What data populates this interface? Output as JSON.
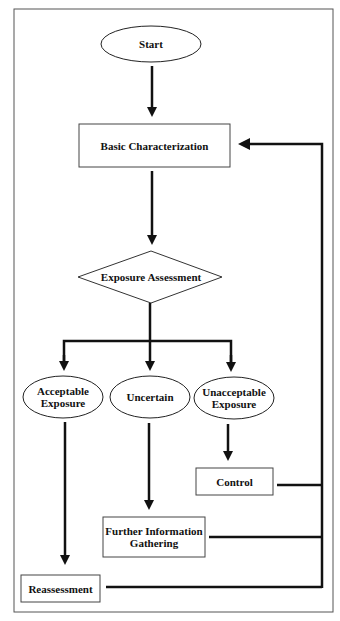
{
  "diagram": {
    "nodes": {
      "start": {
        "label": "Start",
        "shape": "ellipse"
      },
      "basic": {
        "label": "Basic Characterization",
        "shape": "rectangle"
      },
      "assessment": {
        "label": "Exposure Assessment",
        "shape": "diamond"
      },
      "acceptable": {
        "label": "Acceptable Exposure",
        "line1": "Acceptable",
        "line2": "Exposure",
        "shape": "ellipse"
      },
      "uncertain": {
        "label": "Uncertain",
        "shape": "ellipse"
      },
      "unacceptable": {
        "label": "Unacceptable Exposure",
        "line1": "Unacceptable",
        "line2": "Exposure",
        "shape": "ellipse"
      },
      "control": {
        "label": "Control",
        "shape": "rectangle"
      },
      "further": {
        "label": "Further Information Gathering",
        "line1": "Further Information",
        "line2": "Gathering",
        "shape": "rectangle"
      },
      "reassessment": {
        "label": "Reassessment",
        "shape": "rectangle"
      }
    },
    "edges": [
      {
        "from": "Start",
        "to": "Basic Characterization"
      },
      {
        "from": "Basic Characterization",
        "to": "Exposure Assessment"
      },
      {
        "from": "Exposure Assessment",
        "to": "Acceptable Exposure"
      },
      {
        "from": "Exposure Assessment",
        "to": "Uncertain"
      },
      {
        "from": "Exposure Assessment",
        "to": "Unacceptable Exposure"
      },
      {
        "from": "Acceptable Exposure",
        "to": "Reassessment"
      },
      {
        "from": "Uncertain",
        "to": "Further Information Gathering"
      },
      {
        "from": "Unacceptable Exposure",
        "to": "Control"
      },
      {
        "from": "Control",
        "to": "Basic Characterization"
      },
      {
        "from": "Further Information Gathering",
        "to": "Basic Characterization"
      },
      {
        "from": "Reassessment",
        "to": "Basic Characterization"
      }
    ],
    "colors": {
      "stroke": "#111111",
      "background": "#ffffff",
      "frame": "#555555"
    }
  }
}
